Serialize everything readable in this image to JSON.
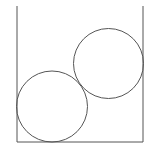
{
  "diagram": {
    "stroke_color": "#555555",
    "background": "#ffffff",
    "container": {
      "left_x": 17,
      "right_x": 143,
      "top_y": 6,
      "bottom_y": 142
    },
    "circles": [
      {
        "label": "lower-circle",
        "cx": 52,
        "cy": 106.5,
        "r": 35.5
      },
      {
        "label": "upper-circle",
        "cx": 108.5,
        "cy": 63.5,
        "r": 35
      }
    ]
  }
}
